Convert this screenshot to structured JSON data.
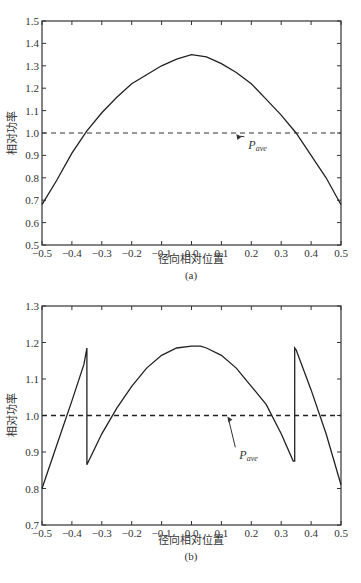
{
  "chart_data": [
    {
      "type": "line",
      "panel_label": "(a)",
      "xlabel": "径向相对位置",
      "ylabel": "相对功率",
      "xlim": [
        -0.5,
        0.5
      ],
      "ylim": [
        0.5,
        1.5
      ],
      "xticks": [
        "-0.5",
        "-0.4",
        "-0.3",
        "-0.2",
        "-0.1",
        "0.0",
        "0.1",
        "0.2",
        "0.3",
        "0.4",
        "0.5"
      ],
      "yticks": [
        "0.5",
        "0.6",
        "0.7",
        "0.8",
        "0.9",
        "1.0",
        "1.1",
        "1.2",
        "1.3",
        "1.4",
        "1.5"
      ],
      "grid": false,
      "series": [
        {
          "name": "相对功率",
          "style": "solid",
          "x": [
            -0.5,
            -0.45,
            -0.4,
            -0.35,
            -0.3,
            -0.25,
            -0.2,
            -0.15,
            -0.1,
            -0.05,
            0.0,
            0.05,
            0.1,
            0.15,
            0.2,
            0.25,
            0.3,
            0.35,
            0.4,
            0.45,
            0.5
          ],
          "y": [
            0.68,
            0.79,
            0.91,
            1.01,
            1.09,
            1.16,
            1.22,
            1.26,
            1.3,
            1.33,
            1.35,
            1.34,
            1.31,
            1.27,
            1.22,
            1.15,
            1.08,
            1.0,
            0.9,
            0.8,
            0.68
          ]
        },
        {
          "name": "P_ave",
          "style": "dashed",
          "x": [
            -0.5,
            0.5
          ],
          "y": [
            1.0,
            1.0
          ]
        }
      ],
      "annotations": [
        {
          "text": "P",
          "subscript": "ave",
          "arrow_to": [
            0.15,
            1.0
          ],
          "text_at": [
            0.19,
            0.93
          ]
        }
      ]
    },
    {
      "type": "line",
      "panel_label": "(b)",
      "xlabel": "径向相对位置",
      "ylabel": "相对功率",
      "xlim": [
        -0.5,
        0.5
      ],
      "ylim": [
        0.7,
        1.3
      ],
      "xticks": [
        "-0.5",
        "-0.4",
        "-0.3",
        "-0.2",
        "-0.1",
        "0.0",
        "0.1",
        "0.2",
        "0.3",
        "0.4",
        "0.5"
      ],
      "yticks": [
        "0.7",
        "0.8",
        "0.9",
        "1.0",
        "1.1",
        "1.2",
        "1.3"
      ],
      "grid": false,
      "series": [
        {
          "name": "相对功率",
          "style": "solid",
          "x": [
            -0.5,
            -0.45,
            -0.4,
            -0.36,
            -0.35,
            -0.35,
            -0.3,
            -0.25,
            -0.2,
            -0.15,
            -0.1,
            -0.05,
            0.0,
            0.03,
            0.05,
            0.1,
            0.15,
            0.2,
            0.25,
            0.3,
            0.34,
            0.345,
            0.345,
            0.35,
            0.4,
            0.45,
            0.5
          ],
          "y": [
            0.8,
            0.92,
            1.04,
            1.14,
            1.185,
            0.865,
            0.95,
            1.02,
            1.08,
            1.13,
            1.165,
            1.185,
            1.19,
            1.19,
            1.185,
            1.165,
            1.13,
            1.08,
            1.03,
            0.95,
            0.875,
            0.875,
            1.185,
            1.18,
            1.07,
            0.95,
            0.81
          ]
        },
        {
          "name": "P_ave",
          "style": "dashed",
          "x": [
            -0.5,
            0.5
          ],
          "y": [
            1.0,
            1.0
          ]
        }
      ],
      "annotations": [
        {
          "text": "P",
          "subscript": "ave",
          "arrow_to": [
            0.12,
            1.0
          ],
          "text_at": [
            0.16,
            0.88
          ]
        }
      ]
    }
  ],
  "panels": {
    "a": {
      "label": "(a)",
      "xlabel": "径向相对位置",
      "ylabel": "相对功率",
      "pave_main": "P",
      "pave_sub": "ave"
    },
    "b": {
      "label": "(b)",
      "xlabel": "径向相对位置",
      "ylabel": "相对功率",
      "pave_main": "P",
      "pave_sub": "ave"
    }
  }
}
